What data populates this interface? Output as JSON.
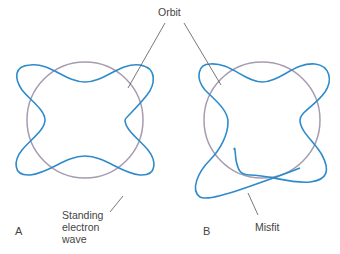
{
  "labels": {
    "orbit": "Orbit",
    "standing_line1": "Standing",
    "standing_line2": "electron",
    "standing_line3": "wave",
    "misfit": "Misfit",
    "panel_a": "A",
    "panel_b": "B"
  },
  "colors": {
    "wave": "#2e8bcb",
    "orbit": "#a79bb0",
    "leader": "#555555",
    "text": "#444444"
  }
}
